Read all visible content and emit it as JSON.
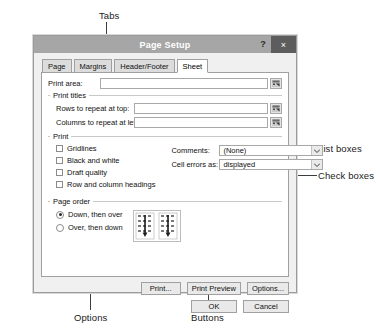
{
  "annotations": {
    "tabs": "Tabs",
    "list_boxes": "List boxes",
    "check_boxes": "Check boxes",
    "options": "Options",
    "buttons": "Buttons"
  },
  "dialog": {
    "title": "Page Setup",
    "help_label": "?",
    "close_label": "×",
    "tabs": [
      {
        "label": "Page",
        "active": false
      },
      {
        "label": "Margins",
        "active": false
      },
      {
        "label": "Header/Footer",
        "active": false
      },
      {
        "label": "Sheet",
        "active": true
      }
    ],
    "sheet": {
      "print_area": {
        "label": "Print area:",
        "value": "",
        "range_icon": "range-select-icon"
      },
      "print_titles": {
        "group_label": "Print titles",
        "rows_label": "Rows to repeat at top:",
        "rows_value": "",
        "cols_label": "Columns to repeat at left:",
        "cols_value": ""
      },
      "print": {
        "group_label": "Print",
        "checkboxes": [
          {
            "label": "Gridlines",
            "checked": false
          },
          {
            "label": "Black and white",
            "checked": false
          },
          {
            "label": "Draft quality",
            "checked": false
          },
          {
            "label": "Row and column headings",
            "checked": false
          }
        ],
        "comments_label": "Comments:",
        "comments_value": "(None)",
        "cell_errors_label": "Cell errors as:",
        "cell_errors_value": "displayed"
      },
      "page_order": {
        "group_label": "Page order",
        "options": [
          {
            "label": "Down, then over",
            "selected": true
          },
          {
            "label": "Over, then down",
            "selected": false
          }
        ]
      }
    },
    "buttons": {
      "print": "Print...",
      "print_preview": "Print Preview",
      "options": "Options...",
      "ok": "OK",
      "cancel": "Cancel"
    }
  },
  "colors": {
    "titlebar": "#a6a6a6",
    "close_button": "#5d5d5d",
    "dialog_face": "#f0f0f0",
    "panel": "#ffffff",
    "annotation_text": "#1a1a1a"
  }
}
